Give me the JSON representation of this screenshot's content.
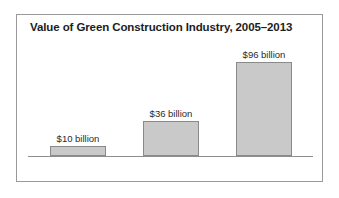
{
  "chart_data": {
    "type": "bar",
    "title": "Value of Green Construction Industry, 2005–2013",
    "xlabel": "",
    "ylabel": "",
    "categories": [
      "2005",
      "2009",
      "2013"
    ],
    "values": [
      10,
      36,
      96
    ],
    "value_labels": [
      "$10 billion",
      "$36 billion",
      "$96 billion"
    ],
    "units": "billion USD",
    "ylim": [
      0,
      118
    ],
    "grid": false,
    "legend": false,
    "bar_fill_color": "#c9c9c9",
    "bar_border_color": "#8a8a8a",
    "axis_color": "#8e8e8e",
    "frame_color": "#9a9a9a",
    "text_color": "#2a2a2a",
    "title_color": "#1d1d1d"
  },
  "figure": {
    "title": "Value of Green Construction Industry, 2005–2013",
    "bars": [
      {
        "category": "2005",
        "value_label": "$10 billion",
        "height_px": 8
      },
      {
        "category": "2009",
        "value_label": "$36 billion",
        "height_px": 31
      },
      {
        "category": "2013",
        "value_label": "$96 billion",
        "height_px": 78
      }
    ]
  }
}
